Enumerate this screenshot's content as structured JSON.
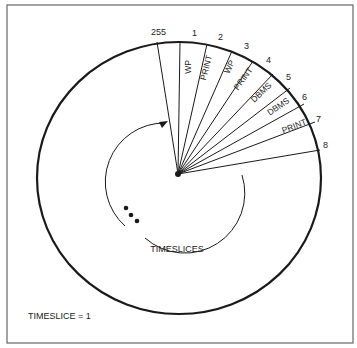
{
  "diagram": {
    "title_label": "TIMESLICES",
    "footer_label": "TIMESLICE = 1",
    "colors": {
      "stroke": "#1a1a1a",
      "frame": "#555555",
      "background": "#ffffff"
    },
    "slot_numbers": [
      {
        "id": "255",
        "label": "255"
      },
      {
        "id": "1",
        "label": "1"
      },
      {
        "id": "2",
        "label": "2"
      },
      {
        "id": "3",
        "label": "3"
      },
      {
        "id": "4",
        "label": "4"
      },
      {
        "id": "5",
        "label": "5"
      },
      {
        "id": "6",
        "label": "6"
      },
      {
        "id": "7",
        "label": "7"
      },
      {
        "id": "8",
        "label": "8"
      }
    ],
    "slices": [
      {
        "slot": "1",
        "task": "WP"
      },
      {
        "slot": "2",
        "task": "PRINT"
      },
      {
        "slot": "3",
        "task": "WP"
      },
      {
        "slot": "4",
        "task": "PRINT"
      },
      {
        "slot": "5",
        "task": "DBMS"
      },
      {
        "slot": "6",
        "task": "DBMS"
      },
      {
        "slot": "7",
        "task": "PRINT"
      }
    ],
    "continuation_marker": "•••",
    "arrow": "clockwise-rotation-arrow"
  }
}
